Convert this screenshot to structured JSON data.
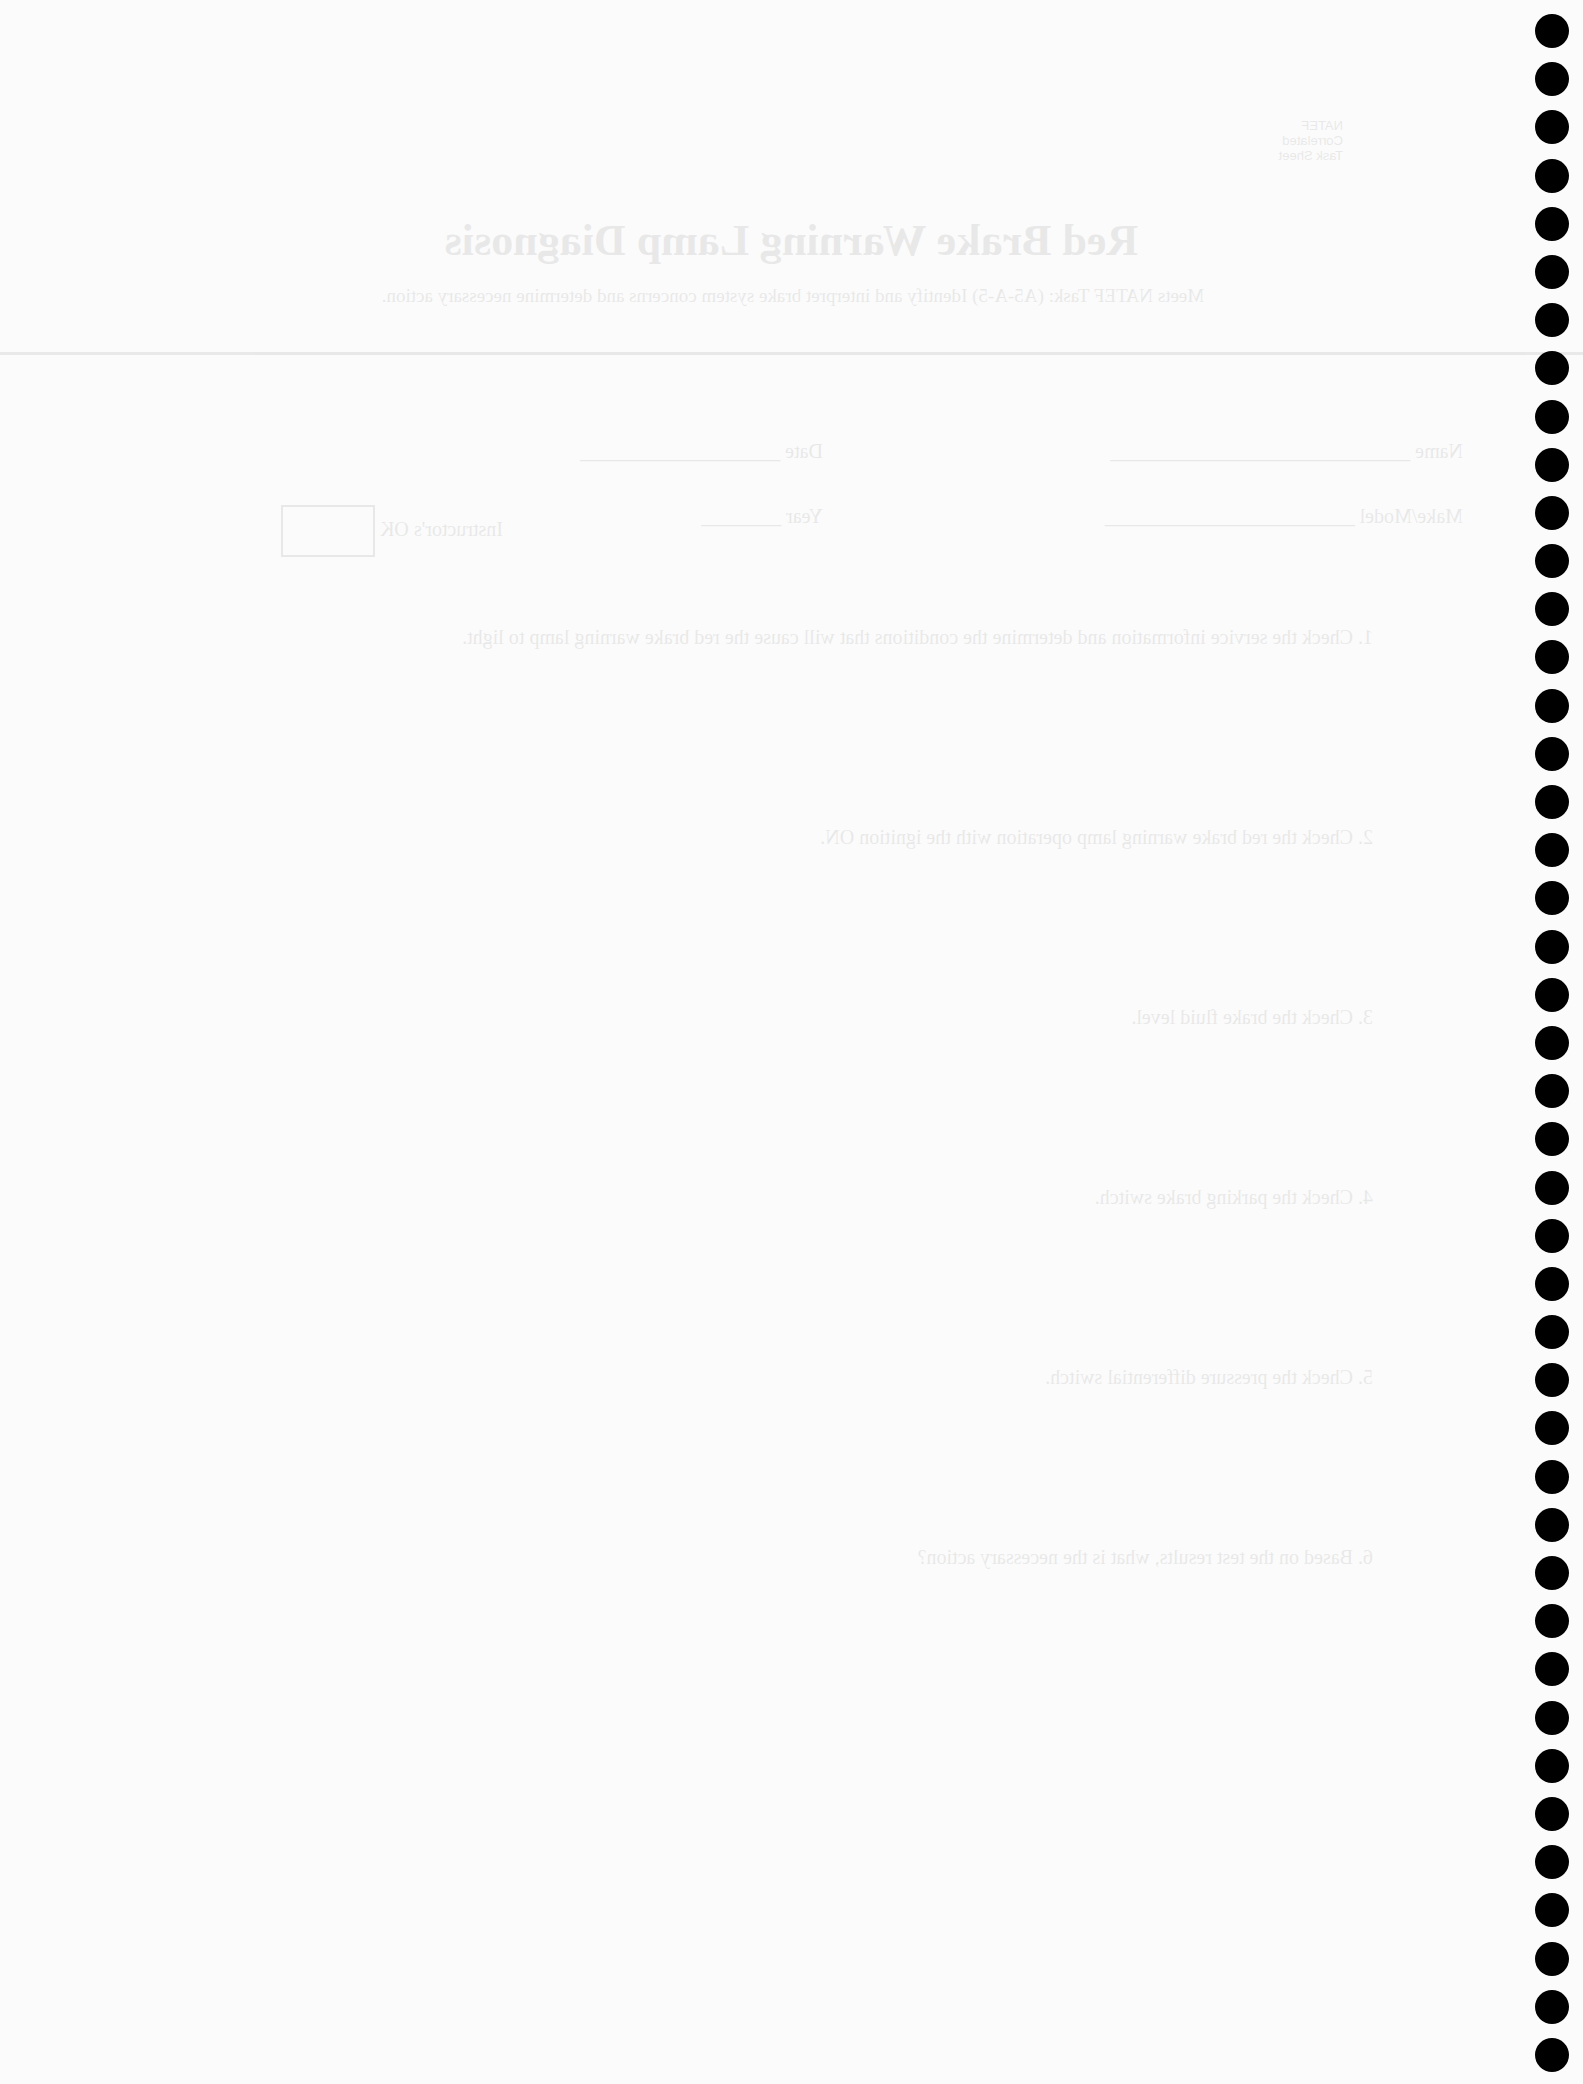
{
  "document": {
    "title": "Red Brake Warning Lamp Diagnosis",
    "subtitle": "Meets NATEF Task: (A5-A-5) Identify and interpret brake system concerns and determine necessary action.",
    "header_tag": [
      "NATEF",
      "Correlated",
      "Task Sheet"
    ],
    "fields": {
      "name_label": "Name",
      "date_label": "Date",
      "make_model_label": "Make/Model",
      "year_label": "Year",
      "instructor_ok_label": "Instructor's OK"
    },
    "questions": [
      "1. Check the service information and determine the conditions that will cause the red brake warning lamp to light.",
      "2. Check the red brake warning lamp operation with the ignition ON.",
      "3. Check the brake fluid level.",
      "4. Check the parking brake switch.",
      "5. Check the pressure differential switch.",
      "6. Based on the test results, what is the necessary action?"
    ],
    "binding_dot_count": 43
  }
}
